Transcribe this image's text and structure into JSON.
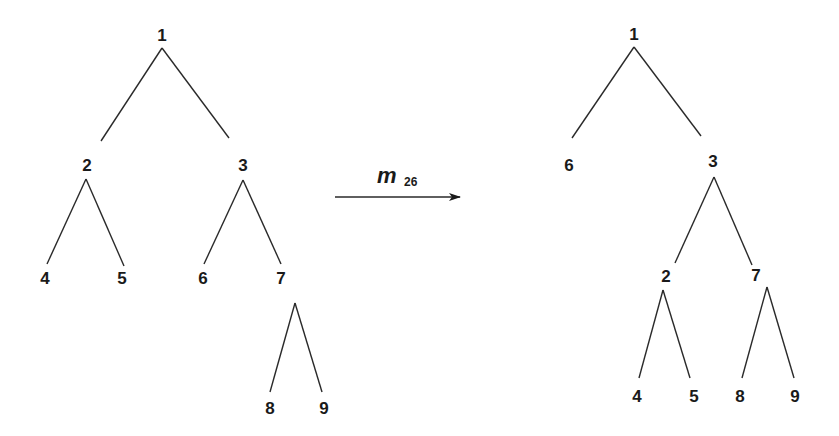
{
  "diagram": {
    "type": "tree-transformation",
    "operation": {
      "symbol": "m",
      "subscript": "26"
    },
    "before_tree": {
      "nodes": [
        {
          "id": "1",
          "label": "1",
          "x": 162,
          "y": 41
        },
        {
          "id": "2",
          "label": "2",
          "x": 87,
          "y": 171
        },
        {
          "id": "3",
          "label": "3",
          "x": 243,
          "y": 171
        },
        {
          "id": "4",
          "label": "4",
          "x": 45,
          "y": 284
        },
        {
          "id": "5",
          "label": "5",
          "x": 122,
          "y": 284
        },
        {
          "id": "6",
          "label": "6",
          "x": 203,
          "y": 284
        },
        {
          "id": "7",
          "label": "7",
          "x": 281,
          "y": 284
        },
        {
          "id": "8",
          "label": "8",
          "x": 270,
          "y": 414
        },
        {
          "id": "9",
          "label": "9",
          "x": 324,
          "y": 414
        }
      ],
      "edges": [
        {
          "from": "1",
          "to": "2",
          "x1": 162,
          "y1": 48,
          "x2": 101,
          "y2": 141
        },
        {
          "from": "1",
          "to": "3",
          "x1": 162,
          "y1": 48,
          "x2": 229,
          "y2": 138
        },
        {
          "from": "2",
          "to": "4",
          "x1": 86,
          "y1": 179,
          "x2": 47,
          "y2": 264
        },
        {
          "from": "2",
          "to": "5",
          "x1": 86,
          "y1": 179,
          "x2": 124,
          "y2": 266
        },
        {
          "from": "3",
          "to": "6",
          "x1": 243,
          "y1": 180,
          "x2": 204,
          "y2": 264
        },
        {
          "from": "3",
          "to": "7",
          "x1": 243,
          "y1": 180,
          "x2": 281,
          "y2": 264
        },
        {
          "from": "7",
          "to": "8",
          "x1": 295,
          "y1": 303,
          "x2": 270,
          "y2": 392
        },
        {
          "from": "7",
          "to": "9",
          "x1": 295,
          "y1": 303,
          "x2": 322,
          "y2": 392
        }
      ]
    },
    "after_tree": {
      "nodes": [
        {
          "id": "1",
          "label": "1",
          "x": 634,
          "y": 40
        },
        {
          "id": "6",
          "label": "6",
          "x": 569,
          "y": 171
        },
        {
          "id": "3",
          "label": "3",
          "x": 713,
          "y": 167
        },
        {
          "id": "2",
          "label": "2",
          "x": 666,
          "y": 282
        },
        {
          "id": "7",
          "label": "7",
          "x": 756,
          "y": 281
        },
        {
          "id": "4",
          "label": "4",
          "x": 637,
          "y": 402
        },
        {
          "id": "5",
          "label": "5",
          "x": 694,
          "y": 402
        },
        {
          "id": "8",
          "label": "8",
          "x": 740,
          "y": 402
        },
        {
          "id": "9",
          "label": "9",
          "x": 795,
          "y": 402
        }
      ],
      "edges": [
        {
          "from": "1",
          "to": "6",
          "x1": 634,
          "y1": 47,
          "x2": 572,
          "y2": 138
        },
        {
          "from": "1",
          "to": "3",
          "x1": 634,
          "y1": 47,
          "x2": 701,
          "y2": 136
        },
        {
          "from": "3",
          "to": "2",
          "x1": 714,
          "y1": 177,
          "x2": 675,
          "y2": 263
        },
        {
          "from": "3",
          "to": "7",
          "x1": 714,
          "y1": 177,
          "x2": 752,
          "y2": 265
        },
        {
          "from": "2",
          "to": "4",
          "x1": 663,
          "y1": 290,
          "x2": 639,
          "y2": 378
        },
        {
          "from": "2",
          "to": "5",
          "x1": 663,
          "y1": 290,
          "x2": 690,
          "y2": 378
        },
        {
          "from": "7",
          "to": "8",
          "x1": 767,
          "y1": 287,
          "x2": 742,
          "y2": 378
        },
        {
          "from": "7",
          "to": "9",
          "x1": 767,
          "y1": 287,
          "x2": 794,
          "y2": 378
        }
      ]
    },
    "arrow": {
      "x1": 335,
      "y1": 197,
      "x2": 460,
      "y2": 197,
      "color": "#1a1a1a"
    }
  }
}
